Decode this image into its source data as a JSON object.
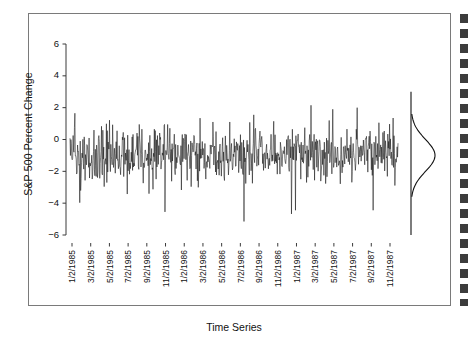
{
  "chart_data": {
    "type": "line",
    "title": "",
    "xlabel": "Time Series",
    "ylabel": "S&P 500 Percent Change",
    "ylim": [
      -6.8,
      6.8
    ],
    "yticks": [
      6,
      4,
      2,
      0,
      -2,
      -4,
      -6
    ],
    "ytick_labels": [
      "6",
      "4",
      "2",
      "0",
      "−2",
      "−4",
      "−6"
    ],
    "xtick_labels": [
      "1/2/1985",
      "3/2/1985",
      "5/2/1985",
      "7/2/1985",
      "9/2/1985",
      "11/2/1985",
      "1/2/1986",
      "3/2/1986",
      "5/2/1986",
      "7/2/1986",
      "9/2/1986",
      "11/2/1986",
      "1/2/1987",
      "3/2/1987",
      "5/2/1987",
      "7/2/1987",
      "9/2/1987",
      "11/2/1987"
    ],
    "grid": false,
    "legend": "none",
    "series": [
      {
        "name": "S&P 500 Percent Change",
        "description": "Daily percent change series, dense high-frequency noise oscillating about a mean near -0.9, with occasional spikes up to about +2.2 and down to about -5.2.",
        "mean": -0.9,
        "min": -5.2,
        "max": 2.2,
        "n_points": 740
      }
    ],
    "marginal_density": {
      "type": "density",
      "orientation": "vertical",
      "description": "Rotated kernel-density / normal curve drawn on a vertical reference line at the right of the plot",
      "center": -1.0,
      "spread": 1.0,
      "axis_range": [
        -6.0,
        3.0
      ]
    }
  },
  "axes": {
    "y_title": "S&P 500 Percent Change",
    "x_title": "Time Series"
  },
  "icons": {
    "scroll_strip": "dashed-strip-icon"
  }
}
